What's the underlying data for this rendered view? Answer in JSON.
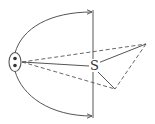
{
  "diagram": {
    "type": "ray-geometry",
    "labels": {
      "s_point": "S"
    },
    "colors": {
      "stroke": "#555555",
      "background": "#ffffff"
    },
    "nodes": {
      "source": {
        "description": "ellipse with two dots",
        "cx": 15,
        "cy": 62
      },
      "s": {
        "label": "S",
        "x": 93,
        "y": 66
      },
      "apex_right": {
        "x": 146,
        "y": 44
      },
      "point_lower": {
        "x": 115,
        "y": 89
      }
    },
    "edges": [
      {
        "from": "source",
        "to": "s",
        "style": "solid"
      },
      {
        "from": "source",
        "to": "apex_right",
        "style": "dashed"
      },
      {
        "from": "source",
        "to": "point_lower",
        "style": "dashed"
      },
      {
        "from": "s",
        "to": "apex_right",
        "style": "solid"
      },
      {
        "from": "s",
        "to": "point_lower",
        "style": "solid"
      },
      {
        "from": "apex_right",
        "to": "point_lower",
        "style": "dashed"
      },
      {
        "from": "source",
        "to": "barrier_top",
        "style": "curved-arrow"
      },
      {
        "from": "source",
        "to": "barrier_bottom",
        "style": "curved-arrow"
      }
    ],
    "barrier": {
      "type": "vertical-line",
      "x": 93,
      "y1": 11,
      "y2": 117
    }
  }
}
